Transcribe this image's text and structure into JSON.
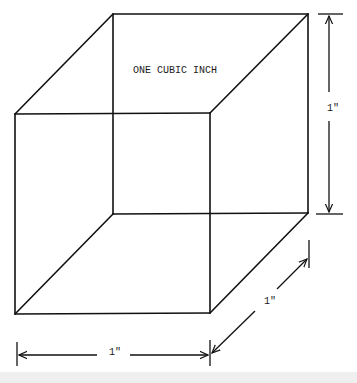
{
  "diagram": {
    "title": "ONE CUBIC INCH",
    "dimensions": {
      "height_label": "1\"",
      "width_label": "1\"",
      "depth_label": "1\""
    },
    "colors": {
      "line": "#111111",
      "background": "#ffffff",
      "bottom_strip": "#efefef"
    }
  }
}
